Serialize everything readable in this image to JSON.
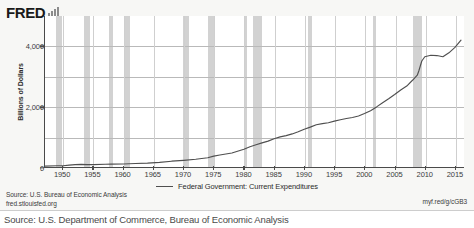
{
  "header": {
    "logo_text": "FRED",
    "logo_icon": "bar-chart-icon"
  },
  "footer": {
    "source_line": "Source: U.S. Bureau of Economic Analysis",
    "site_url": "fred.stlouisfed.org",
    "short_url": "myf.red/g/cGB3"
  },
  "caption": {
    "text": "Source: U.S. Department of Commerce, Bureau of Economic Analysis"
  },
  "colors": {
    "series_line": "#4f4f4f",
    "recession_band": "#d2d2d2",
    "gridline": "#b9b9b9",
    "axis": "#4a4a4a",
    "figure_background": "#f7f7f5",
    "plot_background": "#ffffff"
  },
  "chart_data": {
    "type": "line",
    "title": "",
    "xlabel": "",
    "ylabel": "Billions of Dollars",
    "xlim": [
      1947,
      2016.5
    ],
    "ylim": [
      0,
      5000
    ],
    "grid": true,
    "legend_position": "bottom-center",
    "y_ticks": [
      0,
      2000,
      4000
    ],
    "y_tick_labels": [
      "0",
      "2,000",
      "4,000"
    ],
    "y_gridlines": [
      1000,
      2000,
      3000,
      4000
    ],
    "x_ticks": [
      1950,
      1955,
      1960,
      1965,
      1970,
      1975,
      1980,
      1985,
      1990,
      1995,
      2000,
      2005,
      2010,
      2015
    ],
    "x_tick_labels": [
      "1950",
      "1955",
      "1960",
      "1965",
      "1970",
      "1975",
      "1980",
      "1985",
      "1990",
      "1995",
      "2000",
      "2005",
      "2010",
      "2015"
    ],
    "legend": [
      "Federal Government: Current Expenditures"
    ],
    "series": [
      {
        "name": "Federal Government: Current Expenditures",
        "x": [
          1947,
          1949,
          1950,
          1951,
          1952,
          1953,
          1954,
          1955,
          1957,
          1958,
          1960,
          1962,
          1964,
          1966,
          1968,
          1970,
          1972,
          1974,
          1975,
          1976,
          1978,
          1980,
          1981,
          1982,
          1983,
          1984,
          1985,
          1986,
          1987,
          1988,
          1989,
          1990,
          1991,
          1992,
          1993,
          1994,
          1995,
          1996,
          1997,
          1998,
          1999,
          2000,
          2001,
          2002,
          2003,
          2004,
          2005,
          2006,
          2007,
          2008,
          2008.75,
          2009,
          2009.5,
          2010,
          2011,
          2012,
          2013,
          2014,
          2015,
          2016
        ],
        "y": [
          30,
          41,
          42,
          62,
          79,
          86,
          78,
          78,
          90,
          97,
          100,
          115,
          129,
          152,
          192,
          220,
          256,
          305,
          362,
          398,
          465,
          590,
          672,
          738,
          800,
          858,
          937,
          997,
          1040,
          1095,
          1165,
          1250,
          1320,
          1400,
          1435,
          1465,
          1520,
          1565,
          1605,
          1640,
          1690,
          1770,
          1865,
          1990,
          2130,
          2260,
          2400,
          2550,
          2680,
          2880,
          3040,
          3180,
          3510,
          3650,
          3700,
          3690,
          3650,
          3780,
          3960,
          4200
        ]
      }
    ],
    "recession_bands": [
      {
        "start": 1948.9,
        "end": 1949.8
      },
      {
        "start": 1953.5,
        "end": 1954.4
      },
      {
        "start": 1957.6,
        "end": 1958.3
      },
      {
        "start": 1960.3,
        "end": 1961.1
      },
      {
        "start": 1969.9,
        "end": 1970.9
      },
      {
        "start": 1973.9,
        "end": 1975.2
      },
      {
        "start": 1980.0,
        "end": 1980.5
      },
      {
        "start": 1981.5,
        "end": 1982.9
      },
      {
        "start": 1990.5,
        "end": 1991.2
      },
      {
        "start": 2001.2,
        "end": 2001.8
      },
      {
        "start": 2007.9,
        "end": 2009.4
      }
    ]
  }
}
